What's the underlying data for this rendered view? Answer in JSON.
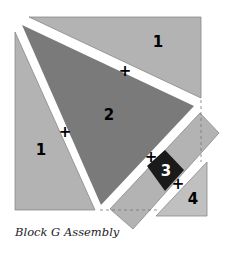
{
  "caption": "Block G Assembly",
  "pieces": [
    {
      "id": "top-1",
      "label": "1",
      "color": "#b3b3b3"
    },
    {
      "id": "center-2",
      "label": "2",
      "color": "#7a7a7a"
    },
    {
      "id": "left-1",
      "label": "1",
      "color": "#b3b3b3"
    },
    {
      "id": "strip",
      "label": "",
      "color": "#b3b3b3"
    },
    {
      "id": "square-3",
      "label": "3",
      "color": "#1a1a1a"
    },
    {
      "id": "corner-4",
      "label": "4",
      "color": "#c0c0c0"
    }
  ],
  "marks": {
    "plus": "+"
  }
}
